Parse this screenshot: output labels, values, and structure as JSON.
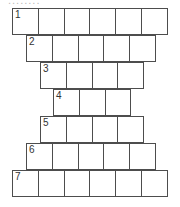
{
  "header": {
    "clipped_text": "........"
  },
  "puzzle": {
    "type": "word-pyramid-grid",
    "line_color": "#4d4d4d",
    "rows": [
      {
        "number": "1",
        "cells": 6,
        "left": 12,
        "top": 8
      },
      {
        "number": "2",
        "cells": 5,
        "left": 26,
        "top": 35
      },
      {
        "number": "3",
        "cells": 4,
        "left": 40,
        "top": 62
      },
      {
        "number": "4",
        "cells": 3,
        "left": 53,
        "top": 89
      },
      {
        "number": "5",
        "cells": 4,
        "left": 40,
        "top": 116
      },
      {
        "number": "6",
        "cells": 5,
        "left": 26,
        "top": 143
      },
      {
        "number": "7",
        "cells": 6,
        "left": 12,
        "top": 170
      }
    ]
  }
}
